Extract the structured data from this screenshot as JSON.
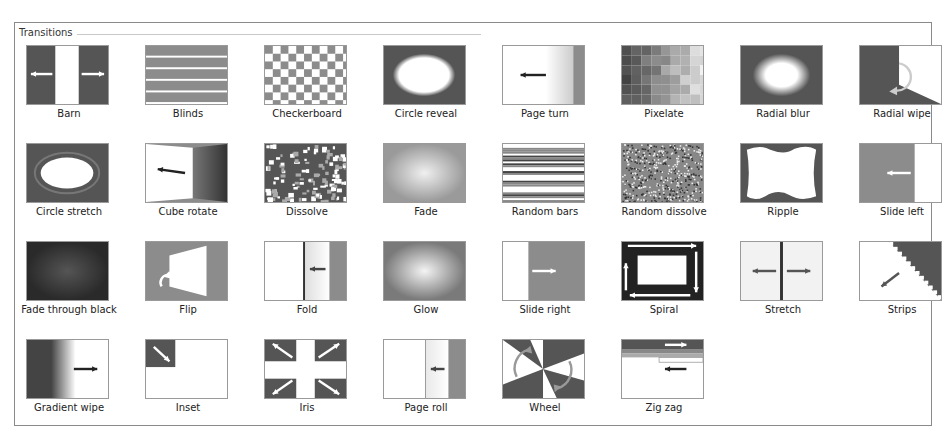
{
  "group": {
    "title": "Transitions"
  },
  "colors": {
    "dark": "#555555",
    "mid": "#8c8c8c",
    "light": "#e8e8e8",
    "border": "#8a8a8a"
  },
  "transitions": [
    {
      "label": "Barn",
      "icon": "barn-icon"
    },
    {
      "label": "Blinds",
      "icon": "blinds-icon"
    },
    {
      "label": "Checkerboard",
      "icon": "checkerboard-icon"
    },
    {
      "label": "Circle reveal",
      "icon": "circle-reveal-icon"
    },
    {
      "label": "Page turn",
      "icon": "page-turn-icon"
    },
    {
      "label": "Pixelate",
      "icon": "pixelate-icon"
    },
    {
      "label": "Radial blur",
      "icon": "radial-blur-icon"
    },
    {
      "label": "Radial wipe",
      "icon": "radial-wipe-icon"
    },
    {
      "label": "Circle stretch",
      "icon": "circle-stretch-icon"
    },
    {
      "label": "Cube rotate",
      "icon": "cube-rotate-icon"
    },
    {
      "label": "Dissolve",
      "icon": "dissolve-icon"
    },
    {
      "label": "Fade",
      "icon": "fade-icon"
    },
    {
      "label": "Random bars",
      "icon": "random-bars-icon"
    },
    {
      "label": "Random dissolve",
      "icon": "random-dissolve-icon"
    },
    {
      "label": "Ripple",
      "icon": "ripple-icon"
    },
    {
      "label": "Slide left",
      "icon": "slide-left-icon"
    },
    {
      "label": "Fade through black",
      "icon": "fade-through-black-icon"
    },
    {
      "label": "Flip",
      "icon": "flip-icon"
    },
    {
      "label": "Fold",
      "icon": "fold-icon"
    },
    {
      "label": "Glow",
      "icon": "glow-icon"
    },
    {
      "label": "Slide right",
      "icon": "slide-right-icon"
    },
    {
      "label": "Spiral",
      "icon": "spiral-icon"
    },
    {
      "label": "Stretch",
      "icon": "stretch-icon"
    },
    {
      "label": "Strips",
      "icon": "strips-icon"
    },
    {
      "label": "Gradient wipe",
      "icon": "gradient-wipe-icon"
    },
    {
      "label": "Inset",
      "icon": "inset-icon"
    },
    {
      "label": "Iris",
      "icon": "iris-icon"
    },
    {
      "label": "Page roll",
      "icon": "page-roll-icon"
    },
    {
      "label": "Wheel",
      "icon": "wheel-icon"
    },
    {
      "label": "Zig zag",
      "icon": "zig-zag-icon"
    }
  ]
}
